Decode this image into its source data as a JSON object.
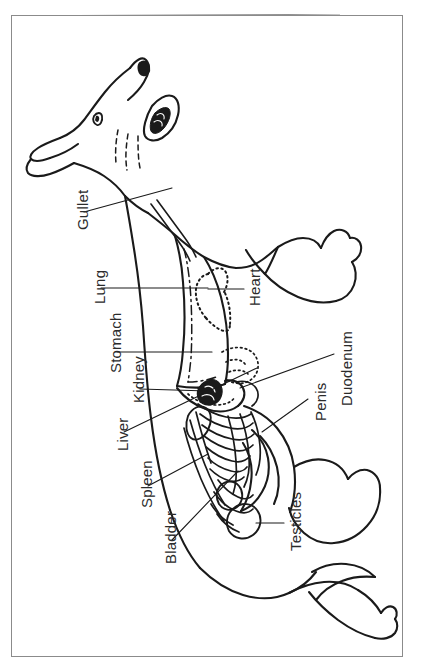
{
  "figure": {
    "orientation": "rotated-90-ccw",
    "frame_color": "#8b8b8b",
    "ink_color": "#1a1a1a",
    "label_color": "#2b2b2b"
  },
  "labels": [
    {
      "name": "gullet",
      "text": "Gullet",
      "x": 62,
      "y": 214,
      "leader": {
        "x1": 72,
        "y1": 196,
        "x2": 160,
        "y2": 172
      }
    },
    {
      "name": "lung",
      "text": "Lung",
      "x": 79,
      "y": 288,
      "leader": {
        "x1": 89,
        "y1": 272,
        "x2": 196,
        "y2": 272
      }
    },
    {
      "name": "heart",
      "text": "Heart",
      "x": 234,
      "y": 290,
      "leader": {
        "x1": 232,
        "y1": 273,
        "x2": 196,
        "y2": 273
      }
    },
    {
      "name": "stomach",
      "text": "Stomach",
      "x": 95,
      "y": 357,
      "leader": {
        "x1": 105,
        "y1": 336,
        "x2": 200,
        "y2": 336
      }
    },
    {
      "name": "kidney",
      "text": "Kidney",
      "x": 118,
      "y": 387,
      "leader": {
        "x1": 128,
        "y1": 373,
        "x2": 196,
        "y2": 375
      }
    },
    {
      "name": "liver",
      "text": "Liver",
      "x": 102,
      "y": 435,
      "leader": {
        "x1": 112,
        "y1": 416,
        "x2": 245,
        "y2": 352
      }
    },
    {
      "name": "spleen",
      "text": "Spleen",
      "x": 126,
      "y": 492,
      "leader": {
        "x1": 136,
        "y1": 470,
        "x2": 196,
        "y2": 438
      }
    },
    {
      "name": "bladder",
      "text": "Bladder",
      "x": 150,
      "y": 548,
      "leader": {
        "x1": 160,
        "y1": 524,
        "x2": 226,
        "y2": 455
      }
    },
    {
      "name": "testicles",
      "text": "Testicles",
      "x": 275,
      "y": 535,
      "leader": {
        "x1": 272,
        "y1": 507,
        "x2": 244,
        "y2": 507
      }
    },
    {
      "name": "penis",
      "text": "Penis",
      "x": 300,
      "y": 405,
      "leader": {
        "x1": 296,
        "y1": 383,
        "x2": 250,
        "y2": 416
      }
    },
    {
      "name": "duodenum",
      "text": "Duodenum",
      "x": 326,
      "y": 390,
      "leader": {
        "x1": 322,
        "y1": 338,
        "x2": 228,
        "y2": 372
      }
    }
  ]
}
